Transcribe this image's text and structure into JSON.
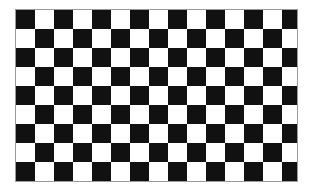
{
  "board": {
    "columns": 15,
    "rows": 9,
    "top_left": "dark",
    "colors": {
      "dark": "#111111",
      "light": "#ffffff",
      "border": "#9a9a9a"
    }
  }
}
